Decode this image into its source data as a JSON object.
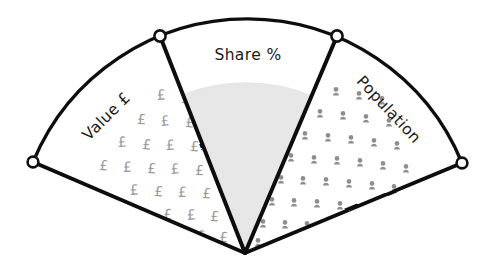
{
  "diagram": {
    "type": "fan-sector-diagram",
    "title": "",
    "background_color": "#ffffff",
    "stroke_color": "#111111",
    "node_fill_color": "#ffffff",
    "segments": [
      {
        "id": "value",
        "label": "Value £",
        "fill_pattern": "pound-symbols",
        "pattern_symbol": "£",
        "pattern_color": "#9a9a9a",
        "fill_color": "#ffffff",
        "label_orientation": "rotated-counter-clockwise"
      },
      {
        "id": "share",
        "label": "Share %",
        "fill_pattern": "stipple-solid",
        "pattern_symbol": "",
        "pattern_color": "#d6d6d6",
        "fill_color": "#d6d6d6",
        "label_orientation": "horizontal"
      },
      {
        "id": "population",
        "label": "Population",
        "fill_pattern": "person-icons",
        "pattern_symbol": "person",
        "pattern_color": "#8e8e8e",
        "fill_color": "#ffffff",
        "label_orientation": "rotated-clockwise"
      }
    ],
    "nodes": [
      {
        "id": "node-left-outer",
        "x": 33,
        "y": 162
      },
      {
        "id": "node-left-inner",
        "x": 160,
        "y": 36
      },
      {
        "id": "node-right-inner",
        "x": 337,
        "y": 36
      },
      {
        "id": "node-right-outer",
        "x": 462,
        "y": 163
      }
    ],
    "apex": {
      "x": 245,
      "y": 253
    }
  }
}
